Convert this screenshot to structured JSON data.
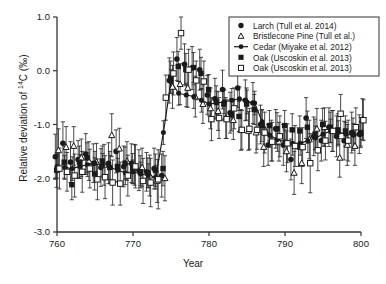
{
  "axes": {
    "xlabel": "Year",
    "ylabel_pre": "Relative deviation of ",
    "ylabel_iso": "14",
    "ylabel_post": "C (‰)",
    "xticks": [
      "760",
      "770",
      "780",
      "790",
      "800"
    ],
    "yticks": [
      "1.0",
      "0.0",
      "-1.0",
      "-2.0",
      "-3.0"
    ]
  },
  "legend": {
    "items": [
      {
        "label": "Larch (Tull et al. 2014)",
        "marker": "filled-circle-icon"
      },
      {
        "label": "Bristlecone Pine (Tull et al.)",
        "marker": "open-triangle-icon"
      },
      {
        "label": "Cedar (Miyake et al. 2012)",
        "marker": "line-circle-icon"
      },
      {
        "label": "Oak (Uscoskin et al. 2013)",
        "marker": "filled-square-icon"
      },
      {
        "label": "Oak (Uscoskin et al. 2013)",
        "marker": "open-square-icon"
      }
    ]
  },
  "chart_data": {
    "type": "scatter",
    "title": "",
    "xlabel": "Year",
    "ylabel": "Relative deviation of 14C (‰)",
    "xlim": [
      760,
      800
    ],
    "ylim": [
      -3.0,
      1.0
    ],
    "xticks": [
      760,
      770,
      780,
      790,
      800
    ],
    "yticks": [
      1.0,
      0.0,
      -1.0,
      -2.0,
      -3.0
    ],
    "grid": false,
    "legend_position": "upper-right",
    "errorbars": true,
    "annotation": "Sharp ~2 per mil rise in atmospheric radiocarbon at AD 774-775",
    "series": [
      {
        "name": "Larch (Tull et al. 2014)",
        "marker": "filled-circle",
        "line": false,
        "x": [
          760,
          761,
          762,
          763,
          764,
          765,
          766,
          767,
          768,
          769,
          770,
          771,
          772,
          773,
          774,
          775,
          776,
          777,
          778,
          779,
          780,
          781,
          782,
          783,
          784,
          785,
          786,
          787,
          788,
          789,
          790,
          791,
          792,
          793,
          794,
          795,
          796,
          797,
          798,
          799,
          800
        ],
        "y": [
          -1.6,
          -1.35,
          -1.7,
          -1.65,
          -1.55,
          -1.72,
          -1.8,
          -1.72,
          -1.5,
          -1.78,
          -1.72,
          -1.85,
          -1.88,
          -1.82,
          -1.95,
          -0.18,
          0.22,
          0.12,
          0.05,
          0.02,
          -0.45,
          -0.52,
          -0.35,
          -0.78,
          -0.32,
          -0.55,
          -0.6,
          -1.0,
          -1.38,
          -1.08,
          -1.38,
          -1.65,
          -1.42,
          -0.88,
          -1.22,
          -1.3,
          -1.05,
          -1.22,
          -1.3,
          -1.15,
          -1.18
        ],
        "yerr": [
          0.42,
          0.4,
          0.38,
          0.35,
          0.38,
          0.36,
          0.35,
          0.38,
          0.4,
          0.38,
          0.36,
          0.38,
          0.36,
          0.38,
          0.4,
          0.42,
          0.4,
          0.38,
          0.4,
          0.38,
          0.36,
          0.38,
          0.36,
          0.38,
          0.36,
          0.38,
          0.38,
          0.36,
          0.38,
          0.36,
          0.38,
          0.38,
          0.36,
          0.38,
          0.36,
          0.38,
          0.36,
          0.38,
          0.36,
          0.38,
          0.36
        ]
      },
      {
        "name": "Bristlecone Pine (Tull et al.)",
        "marker": "open-triangle",
        "line": false,
        "x": [
          760,
          761,
          762,
          763,
          764,
          765,
          766,
          767,
          768,
          769,
          770,
          771,
          772,
          773,
          774,
          775,
          776,
          777,
          778,
          779,
          780,
          781,
          782,
          783,
          784,
          785,
          786,
          787,
          788,
          789,
          790,
          791,
          792,
          793,
          794,
          795,
          796,
          797,
          798,
          799,
          800
        ],
        "y": [
          -1.48,
          -1.42,
          -1.4,
          -1.62,
          -1.68,
          -1.7,
          -1.75,
          -1.2,
          -1.45,
          -1.68,
          -1.75,
          -1.8,
          -1.95,
          -2.05,
          -2.0,
          -0.3,
          -0.25,
          -0.32,
          -0.48,
          -0.62,
          -0.7,
          -0.75,
          -0.88,
          -0.92,
          -1.1,
          -1.12,
          -1.15,
          -1.42,
          -1.3,
          -1.32,
          -1.5,
          -1.9,
          -1.72,
          -1.28,
          -1.08,
          -1.05,
          -1.12,
          -1.62,
          -1.38,
          -1.4,
          -0.9
        ],
        "yerr": [
          0.4,
          0.38,
          0.36,
          0.35,
          0.36,
          0.35,
          0.38,
          0.4,
          0.38,
          0.36,
          0.38,
          0.36,
          0.38,
          0.4,
          0.42,
          0.4,
          0.38,
          0.36,
          0.38,
          0.36,
          0.38,
          0.36,
          0.38,
          0.36,
          0.38,
          0.36,
          0.38,
          0.36,
          0.38,
          0.36,
          0.38,
          0.4,
          0.38,
          0.36,
          0.38,
          0.36,
          0.38,
          0.36,
          0.38,
          0.36,
          0.38
        ]
      },
      {
        "name": "Cedar (Miyake et al. 2012)",
        "marker": "line-circle",
        "line": true,
        "x": [
          760,
          761,
          762,
          763,
          764,
          765,
          766,
          767,
          768,
          769,
          770,
          771,
          772,
          773,
          774,
          775,
          776,
          777,
          778,
          779,
          780,
          781,
          782,
          783,
          784,
          785,
          786,
          787,
          788,
          789,
          790,
          791,
          792,
          793,
          794,
          795,
          796,
          797,
          798,
          799,
          800
        ],
        "y": [
          -1.78,
          -1.8,
          -1.82,
          -1.78,
          -1.75,
          -1.72,
          -1.76,
          -1.8,
          -1.85,
          -1.9,
          -1.88,
          -1.92,
          -1.95,
          -1.98,
          -1.15,
          -0.2,
          -0.42,
          -0.45,
          -0.48,
          -0.55,
          -0.62,
          -0.6,
          -0.58,
          -0.55,
          -0.52,
          -0.58,
          -0.6,
          -0.95,
          -1.2,
          -1.28,
          -1.32,
          -1.35,
          -1.35,
          -1.3,
          -1.25,
          -1.18,
          -1.12,
          -1.15,
          -1.18,
          -1.2,
          -1.18
        ],
        "yerr": [
          0.22,
          0.22,
          0.22,
          0.22,
          0.22,
          0.22,
          0.22,
          0.22,
          0.22,
          0.22,
          0.22,
          0.22,
          0.22,
          0.22,
          0.22,
          0.22,
          0.22,
          0.22,
          0.22,
          0.22,
          0.22,
          0.22,
          0.22,
          0.22,
          0.22,
          0.22,
          0.22,
          0.22,
          0.22,
          0.22,
          0.22,
          0.22,
          0.22,
          0.22,
          0.22,
          0.22,
          0.22,
          0.22,
          0.22,
          0.22,
          0.22
        ]
      },
      {
        "name": "Oak (Uscoskin et al. 2013) filled",
        "marker": "filled-square",
        "line": false,
        "x": [
          760,
          761,
          762,
          763,
          764,
          765,
          766,
          767,
          768,
          769,
          770,
          771,
          772,
          773,
          774,
          775,
          776,
          777,
          778,
          779,
          780,
          781,
          782,
          783,
          784,
          785,
          786,
          787,
          788,
          789,
          790,
          791,
          792,
          793,
          794,
          795,
          796,
          797,
          798,
          799,
          800
        ],
        "y": [
          -1.85,
          -1.7,
          -2.12,
          -1.7,
          -1.62,
          -1.92,
          -1.68,
          -1.8,
          -1.78,
          -1.72,
          -1.82,
          -1.88,
          -1.9,
          -1.85,
          -1.82,
          -0.12,
          0.08,
          0.02,
          0.06,
          -0.05,
          -0.35,
          -0.58,
          -0.62,
          -0.82,
          -0.85,
          -0.62,
          -0.72,
          -1.02,
          -1.02,
          -1.08,
          -1.02,
          -1.1,
          -1.12,
          -1.05,
          -1.18,
          -1.0,
          -1.05,
          -1.1,
          -1.12,
          -1.18,
          -1.15
        ],
        "yerr": [
          0.32,
          0.3,
          0.28,
          0.3,
          0.28,
          0.3,
          0.28,
          0.3,
          0.28,
          0.3,
          0.28,
          0.3,
          0.28,
          0.3,
          0.32,
          0.3,
          0.28,
          0.3,
          0.28,
          0.3,
          0.28,
          0.3,
          0.28,
          0.3,
          0.28,
          0.3,
          0.28,
          0.3,
          0.28,
          0.3,
          0.28,
          0.3,
          0.28,
          0.3,
          0.28,
          0.3,
          0.28,
          0.3,
          0.28,
          0.3,
          0.28
        ]
      },
      {
        "name": "Oak (Uscoskin et al. 2013) open",
        "marker": "open-square",
        "line": false,
        "x": [
          760,
          761,
          762,
          763,
          764,
          765,
          766,
          767,
          768,
          769,
          770,
          771,
          772,
          773,
          774,
          775,
          776,
          777,
          778,
          779,
          780,
          781,
          782,
          783,
          784,
          785,
          786,
          787,
          788,
          789,
          790,
          791,
          792,
          793,
          794,
          795,
          796,
          797,
          798,
          799,
          800
        ],
        "y": [
          -1.82,
          -1.88,
          -1.95,
          -1.88,
          -1.82,
          -2.02,
          -1.98,
          -2.08,
          -2.1,
          -1.95,
          -1.78,
          -2.05,
          -2.08,
          -2.02,
          -0.5,
          -0.05,
          0.7,
          0.02,
          -0.18,
          -0.2,
          -0.9,
          -0.88,
          -0.9,
          -0.7,
          -1.1,
          -1.08,
          -1.1,
          -1.15,
          -1.32,
          -1.22,
          -1.35,
          -1.4,
          -1.42,
          -1.72,
          -1.48,
          -1.3,
          -1.12,
          -0.8,
          -1.3,
          -1.05,
          -0.92
        ],
        "yerr": [
          0.38,
          0.36,
          0.4,
          0.38,
          0.36,
          0.38,
          0.4,
          0.42,
          0.4,
          0.38,
          0.4,
          0.42,
          0.45,
          0.55,
          0.42,
          0.4,
          0.3,
          0.38,
          0.36,
          0.38,
          0.4,
          0.38,
          0.36,
          0.38,
          0.36,
          0.38,
          0.36,
          0.38,
          0.36,
          0.38,
          0.36,
          0.38,
          0.36,
          0.55,
          0.38,
          0.36,
          0.38,
          0.36,
          0.38,
          0.36,
          0.38
        ]
      }
    ]
  }
}
